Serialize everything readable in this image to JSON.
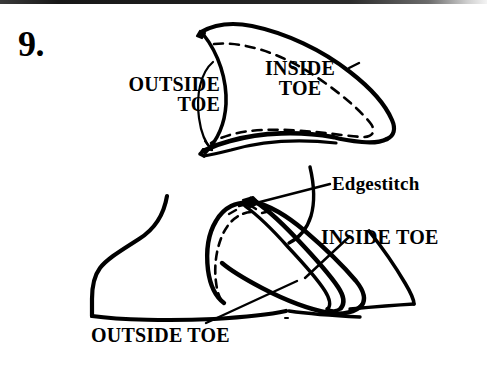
{
  "figure": {
    "step_number": "9.",
    "background_color": "#ffffff",
    "ink_color": "#000000",
    "width": 487,
    "height": 374,
    "caption_font_style": "bold serif uppercase"
  },
  "labels": {
    "outside_toe_top": "OUTSIDE\nTOE",
    "inside_toe_top": "INSIDE\nTOE",
    "edgestitch": "Edgestitch",
    "inside_toe_bottom": "INSIDE TOE",
    "outside_toe_bottom": "OUTSIDE TOE"
  },
  "diagram": {
    "top_piece": {
      "name": "inside-toe-pattern-piece",
      "description": "Pointed leaf-shaped toe panel with dashed stitching line inset from the edge"
    },
    "bottom_scene": {
      "name": "assembled-shoe-toe",
      "description": "Side view of a shoe with the outside toe and inside toe panels overlapping and edgestitched"
    }
  }
}
